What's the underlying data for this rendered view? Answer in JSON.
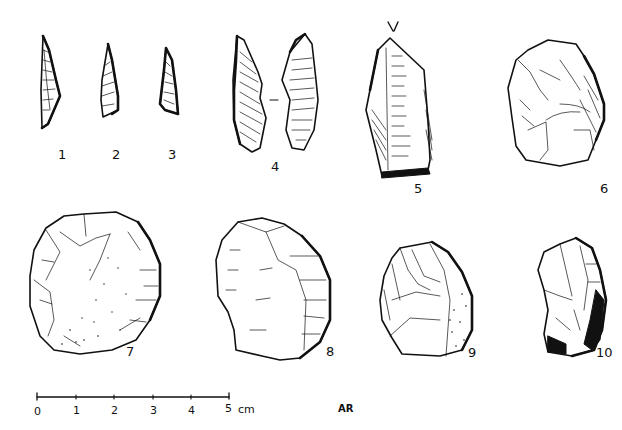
{
  "figure": {
    "type": "archaeological lithic illustration plate",
    "background": "#ffffff",
    "ink_color": "#111111",
    "artifacts": [
      {
        "id": 1,
        "label": "1"
      },
      {
        "id": 2,
        "label": "2"
      },
      {
        "id": 3,
        "label": "3"
      },
      {
        "id": 4,
        "label": "4"
      },
      {
        "id": 5,
        "label": "5"
      },
      {
        "id": 6,
        "label": "6"
      },
      {
        "id": 7,
        "label": "7"
      },
      {
        "id": 8,
        "label": "8"
      },
      {
        "id": 9,
        "label": "9"
      },
      {
        "id": 10,
        "label": "10"
      }
    ],
    "scale_bar": {
      "ticks": [
        "0",
        "1",
        "2",
        "3",
        "4",
        "5"
      ],
      "unit": "cm"
    },
    "signature": "AR"
  }
}
